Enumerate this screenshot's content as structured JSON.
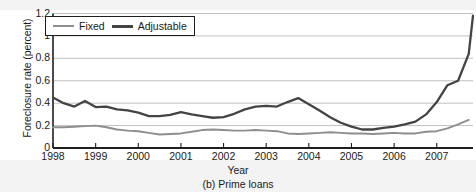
{
  "chart_data": {
    "type": "line",
    "title": "",
    "caption": "(b) Prime loans",
    "xlabel": "Year",
    "ylabel": "Foreclosure rate (percent)",
    "xlim": [
      1998.0,
      2007.85
    ],
    "ylim": [
      0,
      1.2
    ],
    "yticks": [
      0,
      0.2,
      0.4,
      0.6,
      0.8,
      1,
      1.2
    ],
    "ytick_labels": [
      "0",
      "0.2",
      "0.4",
      "0.6",
      "0.8",
      "1",
      "1.2"
    ],
    "xticks": [
      1998,
      1999,
      2000,
      2001,
      2002,
      2003,
      2004,
      2005,
      2006,
      2007
    ],
    "xtick_labels": [
      "1998",
      "1999",
      "2000",
      "2001",
      "2002",
      "2003",
      "2004",
      "2005",
      "2006",
      "2007"
    ],
    "grid": "horizontal",
    "legend_position": "top-left-inside",
    "colors": {
      "fixed": "#8e8e8e",
      "adjustable": "#444444",
      "grid": "#b9b9b9",
      "axis": "#1f1f1f"
    },
    "x": [
      1998.0,
      1998.25,
      1998.5,
      1998.75,
      1999.0,
      1999.25,
      1999.5,
      1999.75,
      2000.0,
      2000.25,
      2000.5,
      2000.75,
      2001.0,
      2001.25,
      2001.5,
      2001.75,
      2002.0,
      2002.25,
      2002.5,
      2002.75,
      2003.0,
      2003.25,
      2003.5,
      2003.75,
      2004.0,
      2004.25,
      2004.5,
      2004.75,
      2005.0,
      2005.25,
      2005.5,
      2005.75,
      2006.0,
      2006.25,
      2006.5,
      2006.75,
      2007.0,
      2007.25,
      2007.5,
      2007.75
    ],
    "series": [
      {
        "name": "Fixed",
        "color": "#8e8e8e",
        "values": [
          0.185,
          0.185,
          0.19,
          0.195,
          0.2,
          0.185,
          0.165,
          0.155,
          0.15,
          0.135,
          0.12,
          0.125,
          0.13,
          0.145,
          0.16,
          0.165,
          0.16,
          0.155,
          0.155,
          0.16,
          0.155,
          0.15,
          0.13,
          0.125,
          0.13,
          0.135,
          0.14,
          0.135,
          0.13,
          0.13,
          0.125,
          0.13,
          0.135,
          0.13,
          0.13,
          0.145,
          0.15,
          0.175,
          0.21,
          0.25
        ]
      },
      {
        "name": "Adjustable",
        "color": "#444444",
        "values": [
          0.45,
          0.4,
          0.37,
          0.42,
          0.365,
          0.37,
          0.345,
          0.335,
          0.315,
          0.285,
          0.285,
          0.295,
          0.32,
          0.3,
          0.285,
          0.27,
          0.275,
          0.305,
          0.345,
          0.37,
          0.375,
          0.37,
          0.41,
          0.445,
          0.39,
          0.335,
          0.275,
          0.225,
          0.19,
          0.165,
          0.16,
          0.17,
          0.165,
          0.165,
          0.175,
          0.165,
          0.165,
          0.17,
          0.175,
          0.2
        ]
      }
    ],
    "series_late_adjustable": {
      "comment_x": [
        2005.5,
        2005.75,
        2006.0,
        2006.25,
        2006.5,
        2006.75,
        2007.0,
        2007.25,
        2007.5,
        2007.75
      ],
      "comment_y": [
        0.165,
        0.18,
        0.19,
        0.21,
        0.235,
        0.3,
        0.41,
        0.56,
        0.6,
        0.84
      ]
    }
  },
  "legend": {
    "items": [
      {
        "label": "Fixed",
        "key": "fixed"
      },
      {
        "label": "Adjustable",
        "key": "adjustable"
      }
    ]
  }
}
